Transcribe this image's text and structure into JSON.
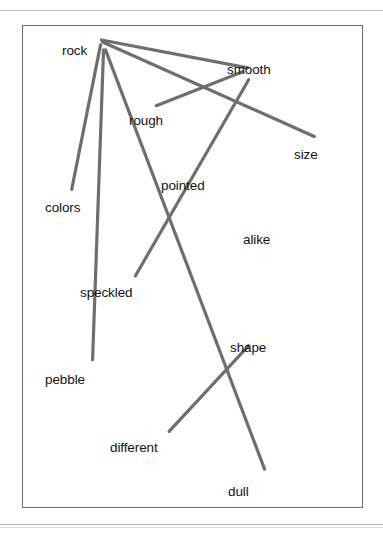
{
  "figure": {
    "kind": "concept-map",
    "background": "#ffffff",
    "frame_border_color": "#6d6d6d",
    "rule_color": "#b9b9b9",
    "edge_color": "#6e6e6e",
    "edge_width": 3.2,
    "label_color": "#121212"
  },
  "nodes": [
    {
      "id": "rock",
      "label": "rock",
      "x": 62,
      "y": 43,
      "anchor_x": 78,
      "anchor_y": 22
    },
    {
      "id": "smooth",
      "label": "smooth",
      "x": 227,
      "y": 62,
      "anchor_x": 226,
      "anchor_y": 45
    },
    {
      "id": "rough",
      "label": "rough",
      "x": 129,
      "y": 113,
      "anchor_x": 167,
      "anchor_y": 96
    },
    {
      "id": "size",
      "label": "size",
      "x": 294,
      "y": 147,
      "anchor_x": 292,
      "anchor_y": 128
    },
    {
      "id": "pointed",
      "label": "pointed",
      "x": 161,
      "y": 178,
      "anchor_x": 183,
      "anchor_y": 170
    },
    {
      "id": "alike",
      "label": "alike",
      "x": 243,
      "y": 232,
      "anchor_x": 243,
      "anchor_y": 232
    },
    {
      "id": "colors",
      "label": "colors",
      "x": 45,
      "y": 200,
      "anchor_x": 48,
      "anchor_y": 184
    },
    {
      "id": "speckled",
      "label": "speckled",
      "x": 80,
      "y": 285,
      "anchor_x": 115,
      "anchor_y": 270
    },
    {
      "id": "pebble",
      "label": "pebble",
      "x": 45,
      "y": 372,
      "anchor_x": 69,
      "anchor_y": 356
    },
    {
      "id": "shape",
      "label": "shape",
      "x": 230,
      "y": 340,
      "anchor_x": 226,
      "anchor_y": 330
    },
    {
      "id": "different",
      "label": "different",
      "x": 110,
      "y": 440,
      "anchor_x": 146,
      "anchor_y": 428
    },
    {
      "id": "dull",
      "label": "dull",
      "x": 228,
      "y": 484,
      "anchor_x": 242,
      "anchor_y": 468
    }
  ],
  "edges": [
    {
      "from": "rock",
      "to": "smooth",
      "x1": 80,
      "y1": 40,
      "x2": 227,
      "y2": 68
    },
    {
      "from": "rock",
      "to": "size",
      "x1": 81,
      "y1": 42,
      "x2": 294,
      "y2": 137
    },
    {
      "from": "rock",
      "to": "colors",
      "x1": 79,
      "y1": 45,
      "x2": 50,
      "y2": 190
    },
    {
      "from": "rock",
      "to": "pebble",
      "x1": 82,
      "y1": 50,
      "x2": 71,
      "y2": 361
    },
    {
      "from": "rock",
      "to": "dull",
      "x1": 84,
      "y1": 50,
      "x2": 244,
      "y2": 471
    },
    {
      "from": "smooth",
      "to": "rough",
      "x1": 222,
      "y1": 72,
      "x2": 135,
      "y2": 106
    },
    {
      "from": "smooth",
      "to": "speckled",
      "x1": 228,
      "y1": 80,
      "x2": 114,
      "y2": 277
    },
    {
      "from": "shape",
      "to": "different",
      "x1": 228,
      "y1": 347,
      "x2": 148,
      "y2": 433
    }
  ],
  "isolated_nodes": [
    "alike"
  ]
}
